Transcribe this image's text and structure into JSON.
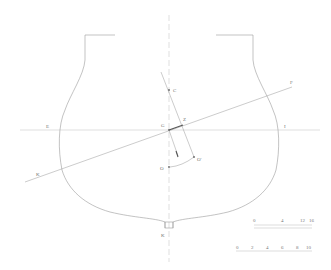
{
  "figure": {
    "type": "ship-stability-cross-section",
    "labels": {
      "C": "C",
      "G": "G",
      "Z": "Z",
      "O": "O",
      "O1": "O'",
      "E": "E",
      "I": "I",
      "F": "F",
      "K": "K",
      "keel": "K"
    },
    "scale_top": [
      "0",
      "4",
      "12",
      "16"
    ],
    "scale_bottom": [
      "0",
      "2",
      "4",
      "6",
      "8",
      "10"
    ]
  },
  "colors": {
    "background": "#ffffff",
    "line": "#9a9a9a",
    "arm": "#555555"
  }
}
